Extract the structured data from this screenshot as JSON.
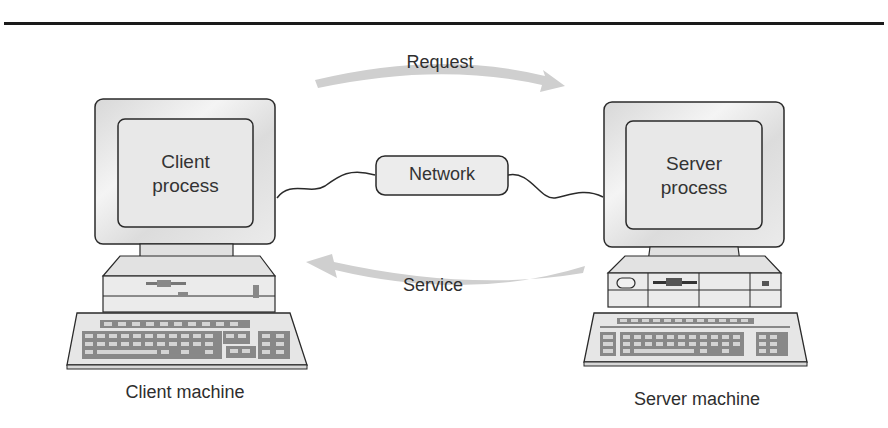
{
  "diagram": {
    "arrows": {
      "request": {
        "label": "Request",
        "direction": "client-to-server"
      },
      "service": {
        "label": "Service",
        "direction": "server-to-client"
      }
    },
    "network": {
      "label": "Network"
    },
    "client": {
      "screen_line1": "Client",
      "screen_line2": "process",
      "caption": "Client machine"
    },
    "server": {
      "screen_line1": "Server",
      "screen_line2": "process",
      "caption": "Server machine"
    },
    "colors": {
      "outline": "#2a2a2a",
      "fill": "#e6e6e6",
      "arrow": "#cfcfcf",
      "rule": "#1a1a1a"
    }
  }
}
